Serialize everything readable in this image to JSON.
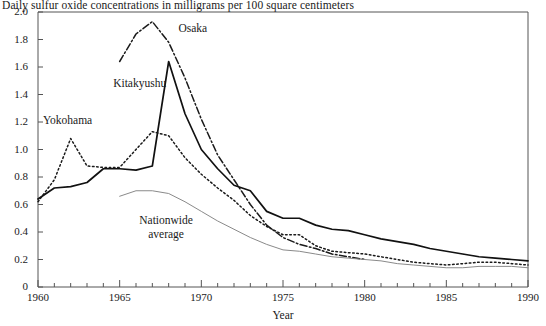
{
  "chart_data": {
    "type": "line",
    "title": "Daily sulfur oxide concentrations in milligrams per 100 square centimeters",
    "xlabel": "Year",
    "ylabel": "",
    "xlim": [
      1960,
      1990
    ],
    "ylim": [
      0,
      2.0
    ],
    "xticks": [
      1960,
      1965,
      1970,
      1975,
      1980,
      1985,
      1990
    ],
    "xtick_labels": [
      "1960",
      "1965",
      "1970",
      "1975",
      "1980",
      "1985",
      "1990"
    ],
    "xminor_step": 1,
    "yticks": [
      0,
      0.2,
      0.4,
      0.6,
      0.8,
      1.0,
      1.2,
      1.4,
      1.6,
      1.8,
      2.0
    ],
    "ytick_labels": [
      "0",
      "0.2",
      "0.4",
      "0.6",
      "0.8",
      "1.0",
      "1.2",
      "1.4",
      "1.6",
      "1.8",
      "2.0"
    ],
    "grid": false,
    "legend_position": "inline-annotations",
    "frame": [
      "left",
      "top"
    ],
    "series": [
      {
        "name": "Osaka",
        "style": "dash-dot",
        "color": "#1a1a1a",
        "label_x": 1968.6,
        "label_y": 1.87,
        "x": [
          1965,
          1966,
          1967,
          1968,
          1969,
          1970,
          1971,
          1972,
          1973,
          1974,
          1975,
          1976,
          1977,
          1978,
          1979,
          1980
        ],
        "y": [
          1.64,
          1.84,
          1.93,
          1.78,
          1.52,
          1.22,
          0.96,
          0.78,
          0.6,
          0.45,
          0.36,
          0.31,
          0.28,
          0.24,
          0.22,
          0.2
        ]
      },
      {
        "name": "Kitakyushu",
        "style": "solid",
        "color": "#111111",
        "label_x": 1964.6,
        "label_y": 1.47,
        "x": [
          1960,
          1961,
          1962,
          1963,
          1964,
          1965,
          1966,
          1967,
          1968,
          1969,
          1970,
          1971,
          1972,
          1973,
          1974,
          1975,
          1976,
          1977,
          1978,
          1979,
          1980,
          1981,
          1982,
          1983,
          1984,
          1985,
          1986,
          1987,
          1988,
          1989,
          1990
        ],
        "y": [
          0.64,
          0.72,
          0.73,
          0.76,
          0.86,
          0.86,
          0.85,
          0.88,
          1.64,
          1.26,
          1.0,
          0.86,
          0.74,
          0.7,
          0.55,
          0.5,
          0.5,
          0.45,
          0.42,
          0.41,
          0.38,
          0.35,
          0.33,
          0.31,
          0.28,
          0.26,
          0.24,
          0.22,
          0.21,
          0.2,
          0.19
        ]
      },
      {
        "name": "Yokohama",
        "style": "dotted",
        "color": "#1a1a1a",
        "label_x": 1960.3,
        "label_y": 1.2,
        "x": [
          1960,
          1961,
          1962,
          1963,
          1964,
          1965,
          1966,
          1967,
          1968,
          1969,
          1970,
          1971,
          1972,
          1973,
          1974,
          1975,
          1976,
          1977,
          1978,
          1979,
          1980,
          1981,
          1982,
          1983,
          1984,
          1985,
          1986,
          1987,
          1988,
          1989,
          1990
        ],
        "y": [
          0.62,
          0.78,
          1.08,
          0.88,
          0.87,
          0.87,
          1.0,
          1.13,
          1.1,
          0.94,
          0.82,
          0.72,
          0.63,
          0.52,
          0.44,
          0.38,
          0.38,
          0.3,
          0.26,
          0.25,
          0.24,
          0.22,
          0.2,
          0.18,
          0.17,
          0.16,
          0.17,
          0.18,
          0.18,
          0.17,
          0.16
        ]
      },
      {
        "name": "Nationwide average",
        "style": "thin-solid",
        "color": "#8a8a8a",
        "label_x": 1966.2,
        "label_y": 0.47,
        "x": [
          1965,
          1966,
          1967,
          1968,
          1969,
          1970,
          1971,
          1972,
          1973,
          1974,
          1975,
          1976,
          1977,
          1978,
          1979,
          1980,
          1981,
          1982,
          1983,
          1984,
          1985,
          1986,
          1987,
          1988,
          1989,
          1990
        ],
        "y": [
          0.66,
          0.7,
          0.7,
          0.68,
          0.62,
          0.55,
          0.48,
          0.42,
          0.36,
          0.31,
          0.27,
          0.26,
          0.24,
          0.22,
          0.21,
          0.2,
          0.19,
          0.17,
          0.16,
          0.15,
          0.14,
          0.14,
          0.15,
          0.15,
          0.15,
          0.14
        ]
      }
    ]
  }
}
